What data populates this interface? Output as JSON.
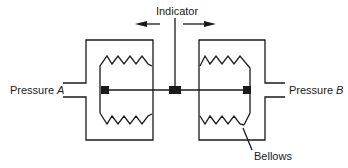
{
  "diagram": {
    "type": "differential pressure gauge (bellows type)",
    "labels": {
      "indicator": "Indicator",
      "pressure_a_prefix": "Pressure ",
      "pressure_a_var": "A",
      "pressure_b_prefix": "Pressure ",
      "pressure_b_var": "B",
      "bellows": "Bellows"
    },
    "components": [
      {
        "id": "left-chamber",
        "desc": "Chamber connected to Pressure A"
      },
      {
        "id": "right-chamber",
        "desc": "Chamber connected to Pressure B"
      },
      {
        "id": "left-bellows",
        "desc": "Bellows inside left chamber"
      },
      {
        "id": "right-bellows",
        "desc": "Bellows inside right chamber"
      },
      {
        "id": "connecting-rod",
        "desc": "Rod linking both bellows"
      },
      {
        "id": "indicator-pointer",
        "desc": "Vertical pointer attached to rod center"
      },
      {
        "id": "motion-arrows",
        "desc": "Left/right arrows showing indicator motion"
      }
    ],
    "colors": {
      "ink": "#1a1a1a",
      "background": "#ffffff"
    }
  }
}
